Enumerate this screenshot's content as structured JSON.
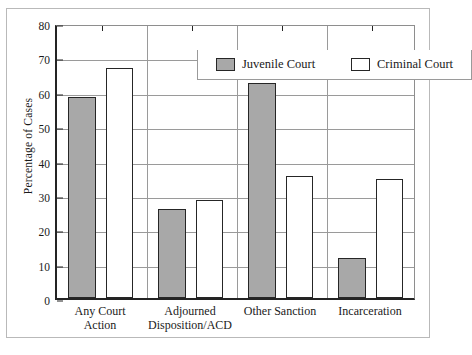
{
  "chart_data": {
    "type": "bar",
    "title": "",
    "xlabel": "",
    "ylabel": "Percentage of Cases",
    "ylim": [
      0,
      80
    ],
    "ytick_step": 10,
    "yticks": [
      "0",
      "10",
      "20",
      "30",
      "40",
      "50",
      "60",
      "70",
      "80"
    ],
    "grid": true,
    "legend_position": "top-right inside plot",
    "categories": [
      "Any Court Action",
      "Adjourned Disposition/ACD",
      "Other Sanction",
      "Incarceration"
    ],
    "category_lines": [
      [
        "Any Court",
        "Action"
      ],
      [
        "Adjourned",
        "Disposition/ACD"
      ],
      [
        "Other Sanction",
        ""
      ],
      [
        "Incarceration",
        ""
      ]
    ],
    "series": [
      {
        "name": "Juvenile Court",
        "color": "#a8a8a8",
        "values": [
          58.5,
          26,
          62.5,
          11.5
        ]
      },
      {
        "name": "Criminal Court",
        "color": "#ffffff",
        "values": [
          67,
          28.5,
          35.5,
          34.5
        ]
      }
    ]
  },
  "legend": {
    "entries": [
      {
        "label": "Juvenile Court",
        "swatch": "filled-gray-swatch"
      },
      {
        "label": "Criminal Court",
        "swatch": "empty-white-swatch"
      }
    ]
  }
}
